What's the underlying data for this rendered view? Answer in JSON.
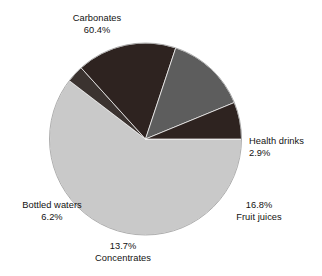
{
  "chart_data": {
    "type": "pie",
    "title": "",
    "subtitle": "",
    "xlabel": "",
    "ylabel": "",
    "legend_position": "none",
    "grid": false,
    "labels_outside": true,
    "unit": "%",
    "categories": [
      "Carbonates",
      "Health drinks",
      "Fruit juices",
      "Concentrates",
      "Bottled waters"
    ],
    "values": [
      60.4,
      2.9,
      16.8,
      13.7,
      6.2
    ],
    "value_labels": [
      "60.4%",
      "2.9%",
      "16.8%",
      "13.7%",
      "6.2%"
    ],
    "colors": [
      "#c9c9c9",
      "#3b3330",
      "#2e2320",
      "#5d5d5d",
      "#2e2320"
    ],
    "slices": [
      {
        "name": "Carbonates",
        "value": 60.4,
        "value_label": "60.4%",
        "color": "#c9c9c9"
      },
      {
        "name": "Health drinks",
        "value": 2.9,
        "value_label": "2.9%",
        "color": "#3b3330"
      },
      {
        "name": "Fruit juices",
        "value": 16.8,
        "value_label": "16.8%",
        "color": "#2e2320"
      },
      {
        "name": "Concentrates",
        "value": 13.7,
        "value_label": "13.7%",
        "color": "#5d5d5d"
      },
      {
        "name": "Bottled waters",
        "value": 6.2,
        "value_label": "6.2%",
        "color": "#2e2320"
      }
    ]
  },
  "labels": {
    "carbonates": {
      "name": "Carbonates",
      "value": "60.4%"
    },
    "health_drinks": {
      "name": "Health drinks",
      "value": "2.9%"
    },
    "fruit_juices": {
      "name": "Fruit juices",
      "value": "16.8%"
    },
    "concentrates": {
      "name": "Concentrates",
      "value": "13.7%"
    },
    "bottled_waters": {
      "name": "Bottled waters",
      "value": "6.2%"
    }
  }
}
